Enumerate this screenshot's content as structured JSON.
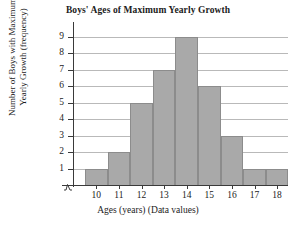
{
  "chart_data": {
    "type": "bar",
    "title": "Boys' Ages of Maximum Yearly Growth",
    "xlabel": "Ages (years) (Data values)",
    "ylabel_line1": "Number of Boys with Maximum",
    "ylabel_line2": "Yearly Growth (frequency)",
    "categories": [
      "10",
      "11",
      "12",
      "13",
      "14",
      "15",
      "16",
      "17",
      "18"
    ],
    "values": [
      1,
      2,
      5,
      7,
      9,
      6,
      3,
      1,
      1
    ],
    "ylim": [
      0,
      9
    ],
    "yticks": [
      "1",
      "2",
      "3",
      "4",
      "5",
      "6",
      "7",
      "8",
      "9"
    ],
    "grid": true,
    "legend": "none",
    "bar_color": "#a9a9a9",
    "bar_border_color": "#8c8c8c",
    "gridline_color": "#b9b9b9",
    "axis_color": "#3a3a3a",
    "axis_break": true
  }
}
